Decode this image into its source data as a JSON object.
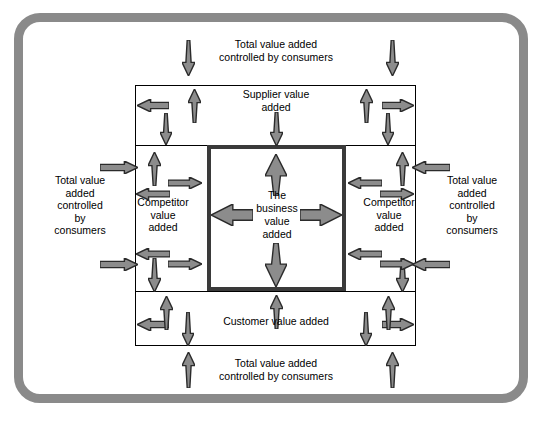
{
  "diagram": {
    "title": "Total value added controlled by consumers",
    "colors": {
      "frame": "#8a8a8a",
      "arrow_fill": "#8c8c8c",
      "arrow_stroke": "#2b2b2b",
      "box_stroke": "#000000",
      "inner_box_stroke": "#3a3a3a",
      "background": "#ffffff",
      "text": "#000000"
    },
    "labels": {
      "top_outer": "Total value added\ncontrolled by consumers",
      "bottom_outer": "Total value added\ncontrolled by consumers",
      "left_outer": "Total value\nadded\ncontrolled\nby\nconsumers",
      "right_outer": "Total value\nadded\ncontrolled\nby\nconsumers",
      "supplier": "Supplier value\nadded",
      "customer": "Customer value added",
      "competitor_left": "Competitor\nvalue\nadded",
      "competitor_right": "Competitor\nvalue\nadded",
      "business": "The\nbusiness\nvalue\nadded"
    },
    "arrows": [
      {
        "name": "arrow-external-top-left-down",
        "dir": "down",
        "x": 182,
        "y": 40,
        "len": 36,
        "w": 13,
        "style": "tapered"
      },
      {
        "name": "arrow-external-top-right-down",
        "dir": "down",
        "x": 386,
        "y": 40,
        "len": 36,
        "w": 13,
        "style": "tapered"
      },
      {
        "name": "arrow-external-bottom-left-up",
        "dir": "up",
        "x": 182,
        "y": 352,
        "len": 36,
        "w": 13,
        "style": "tapered"
      },
      {
        "name": "arrow-external-bottom-right-up",
        "dir": "up",
        "x": 386,
        "y": 352,
        "len": 36,
        "w": 13,
        "style": "tapered"
      },
      {
        "name": "arrow-external-left-top-right",
        "dir": "right",
        "x": 100,
        "y": 161,
        "len": 38,
        "w": 13,
        "style": "block"
      },
      {
        "name": "arrow-external-left-bottom-right",
        "dir": "right",
        "x": 100,
        "y": 258,
        "len": 38,
        "w": 13,
        "style": "block"
      },
      {
        "name": "arrow-external-right-top-left",
        "dir": "left",
        "x": 412,
        "y": 161,
        "len": 38,
        "w": 13,
        "style": "block"
      },
      {
        "name": "arrow-external-right-bottom-left",
        "dir": "left",
        "x": 412,
        "y": 258,
        "len": 38,
        "w": 13,
        "style": "block"
      },
      {
        "name": "arrow-top-band-left-out",
        "dir": "left",
        "x": 137,
        "y": 99,
        "len": 32,
        "w": 13,
        "style": "block"
      },
      {
        "name": "arrow-top-band-right-out",
        "dir": "right",
        "x": 382,
        "y": 99,
        "len": 32,
        "w": 13,
        "style": "block"
      },
      {
        "name": "arrow-top-band-left-up",
        "dir": "up",
        "x": 188,
        "y": 89,
        "len": 34,
        "w": 13,
        "style": "tapered"
      },
      {
        "name": "arrow-top-band-right-up",
        "dir": "up",
        "x": 360,
        "y": 89,
        "len": 34,
        "w": 13,
        "style": "tapered"
      },
      {
        "name": "arrow-top-band-left-down",
        "dir": "down",
        "x": 160,
        "y": 113,
        "len": 32,
        "w": 12,
        "style": "tapered"
      },
      {
        "name": "arrow-top-band-right-down",
        "dir": "down",
        "x": 382,
        "y": 113,
        "len": 32,
        "w": 12,
        "style": "tapered"
      },
      {
        "name": "arrow-supplier-down",
        "dir": "down",
        "x": 270,
        "y": 112,
        "len": 34,
        "w": 13,
        "style": "tapered"
      },
      {
        "name": "arrow-bottom-band-left-out",
        "dir": "left",
        "x": 137,
        "y": 318,
        "len": 32,
        "w": 13,
        "style": "block"
      },
      {
        "name": "arrow-bottom-band-right-out",
        "dir": "right",
        "x": 382,
        "y": 318,
        "len": 32,
        "w": 13,
        "style": "block"
      },
      {
        "name": "arrow-bottom-band-left-up",
        "dir": "up",
        "x": 160,
        "y": 296,
        "len": 34,
        "w": 13,
        "style": "tapered"
      },
      {
        "name": "arrow-bottom-band-right-up",
        "dir": "up",
        "x": 382,
        "y": 296,
        "len": 34,
        "w": 13,
        "style": "tapered"
      },
      {
        "name": "arrow-bottom-band-left-down",
        "dir": "down",
        "x": 182,
        "y": 312,
        "len": 34,
        "w": 12,
        "style": "tapered"
      },
      {
        "name": "arrow-bottom-band-right-down",
        "dir": "down",
        "x": 360,
        "y": 312,
        "len": 34,
        "w": 12,
        "style": "tapered"
      },
      {
        "name": "arrow-customer-up",
        "dir": "up",
        "x": 270,
        "y": 295,
        "len": 34,
        "w": 13,
        "style": "tapered"
      },
      {
        "name": "arrow-left-band-up",
        "dir": "up",
        "x": 148,
        "y": 152,
        "len": 34,
        "w": 13,
        "style": "tapered"
      },
      {
        "name": "arrow-left-band-down",
        "dir": "down",
        "x": 148,
        "y": 258,
        "len": 34,
        "w": 13,
        "style": "tapered"
      },
      {
        "name": "arrow-left-band-in-top-right",
        "dir": "right",
        "x": 168,
        "y": 177,
        "len": 34,
        "w": 12,
        "style": "block"
      },
      {
        "name": "arrow-left-band-in-bottom-right",
        "dir": "right",
        "x": 168,
        "y": 258,
        "len": 34,
        "w": 12,
        "style": "block"
      },
      {
        "name": "arrow-left-band-out-top-left",
        "dir": "left",
        "x": 136,
        "y": 188,
        "len": 34,
        "w": 12,
        "style": "block"
      },
      {
        "name": "arrow-left-band-out-bottom-left",
        "dir": "left",
        "x": 136,
        "y": 248,
        "len": 34,
        "w": 12,
        "style": "block"
      },
      {
        "name": "arrow-right-band-up",
        "dir": "up",
        "x": 396,
        "y": 152,
        "len": 34,
        "w": 13,
        "style": "tapered"
      },
      {
        "name": "arrow-right-band-down",
        "dir": "down",
        "x": 396,
        "y": 258,
        "len": 34,
        "w": 13,
        "style": "tapered"
      },
      {
        "name": "arrow-right-band-in-top-left",
        "dir": "left",
        "x": 348,
        "y": 177,
        "len": 34,
        "w": 12,
        "style": "block"
      },
      {
        "name": "arrow-right-band-in-bottom-left",
        "dir": "left",
        "x": 348,
        "y": 248,
        "len": 34,
        "w": 12,
        "style": "block"
      },
      {
        "name": "arrow-right-band-out-top-right",
        "dir": "right",
        "x": 380,
        "y": 188,
        "len": 34,
        "w": 12,
        "style": "block"
      },
      {
        "name": "arrow-right-band-out-bottom-right",
        "dir": "right",
        "x": 380,
        "y": 258,
        "len": 34,
        "w": 12,
        "style": "block"
      },
      {
        "name": "arrow-business-up",
        "dir": "up",
        "x": 265,
        "y": 154,
        "len": 42,
        "w": 22,
        "style": "tapered"
      },
      {
        "name": "arrow-business-down",
        "dir": "down",
        "x": 265,
        "y": 243,
        "len": 44,
        "w": 22,
        "style": "tapered"
      },
      {
        "name": "arrow-business-left",
        "dir": "left",
        "x": 211,
        "y": 204,
        "len": 42,
        "w": 22,
        "style": "block"
      },
      {
        "name": "arrow-business-right",
        "dir": "right",
        "x": 300,
        "y": 204,
        "len": 42,
        "w": 22,
        "style": "block"
      }
    ]
  }
}
